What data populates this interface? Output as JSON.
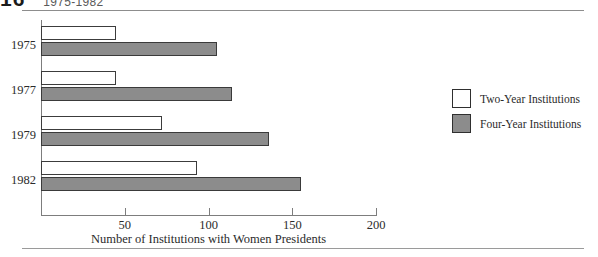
{
  "page": {
    "heading_number": "16",
    "heading_text": "1975-1982"
  },
  "legend": {
    "position": "right",
    "items": [
      {
        "label": "Two-Year Institutions",
        "color": "#ffffff",
        "swatch": "two"
      },
      {
        "label": "Four-Year Institutions",
        "color": "#8c8c8c",
        "swatch": "four"
      }
    ]
  },
  "chart_data": {
    "type": "bar",
    "orientation": "horizontal",
    "title": "",
    "xlabel": "Number of Institutions with Women Presidents",
    "ylabel": "",
    "categories": [
      "1975",
      "1977",
      "1979",
      "1982"
    ],
    "series": [
      {
        "name": "Two-Year Institutions",
        "color": "#ffffff",
        "values": [
          45,
          45,
          72,
          93
        ]
      },
      {
        "name": "Four-Year Institutions",
        "color": "#8c8c8c",
        "values": [
          105,
          114,
          136,
          155
        ]
      }
    ],
    "xlim": [
      0,
      200
    ],
    "xticks": [
      50,
      100,
      150,
      200
    ],
    "xticklabels": [
      "50",
      "100",
      "150",
      "200"
    ],
    "grid": false
  }
}
